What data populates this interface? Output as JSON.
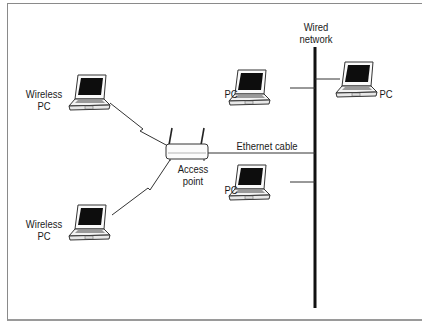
{
  "diagram": {
    "colors": {
      "line": "#111111",
      "screen": "#0d0d0d",
      "frame": "#8a8a8a",
      "background": "#ffffff"
    },
    "nodes": {
      "wireless_pc_top": {
        "label_line1": "Wireless",
        "label_line2": "PC",
        "icon": "laptop-icon"
      },
      "wireless_pc_bottom": {
        "label_line1": "Wireless",
        "label_line2": "PC",
        "icon": "laptop-icon"
      },
      "access_point": {
        "label_line1": "Access",
        "label_line2": "point",
        "icon": "wireless-router-icon"
      },
      "pc_upper": {
        "label": "PC",
        "icon": "laptop-icon"
      },
      "pc_right": {
        "label": "PC",
        "icon": "laptop-icon"
      },
      "pc_lower": {
        "label": "PC",
        "icon": "laptop-icon"
      },
      "wired_network": {
        "label_line1": "Wired",
        "label_line2": "network"
      }
    },
    "edges": {
      "ethernet_cable": {
        "label": "Ethernet cable"
      }
    }
  }
}
